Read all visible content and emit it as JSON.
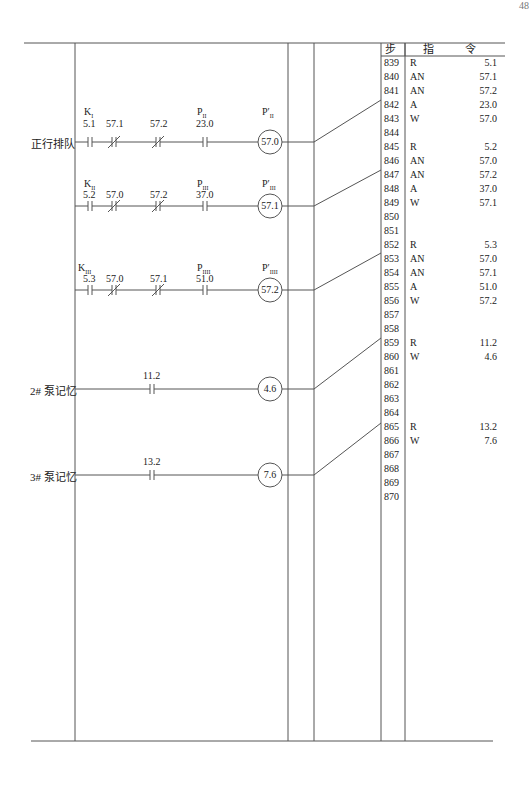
{
  "page": {
    "number": "48"
  },
  "table": {
    "header": {
      "step": "步",
      "instruction": "指 令"
    },
    "rows": [
      {
        "step": "839",
        "op": "R",
        "addr": "5.1"
      },
      {
        "step": "840",
        "op": "AN",
        "addr": "57.1"
      },
      {
        "step": "841",
        "op": "AN",
        "addr": "57.2"
      },
      {
        "step": "842",
        "op": "A",
        "addr": "23.0"
      },
      {
        "step": "843",
        "op": "W",
        "addr": "57.0"
      },
      {
        "step": "844",
        "op": "",
        "addr": ""
      },
      {
        "step": "845",
        "op": "R",
        "addr": "5.2"
      },
      {
        "step": "846",
        "op": "AN",
        "addr": "57.0"
      },
      {
        "step": "847",
        "op": "AN",
        "addr": "57.2"
      },
      {
        "step": "848",
        "op": "A",
        "addr": "37.0"
      },
      {
        "step": "849",
        "op": "W",
        "addr": "57.1"
      },
      {
        "step": "850",
        "op": "",
        "addr": ""
      },
      {
        "step": "851",
        "op": "",
        "addr": ""
      },
      {
        "step": "852",
        "op": "R",
        "addr": "5.3"
      },
      {
        "step": "853",
        "op": "AN",
        "addr": "57.0"
      },
      {
        "step": "854",
        "op": "AN",
        "addr": "57.1"
      },
      {
        "step": "855",
        "op": "A",
        "addr": "51.0"
      },
      {
        "step": "856",
        "op": "W",
        "addr": "57.2"
      },
      {
        "step": "857",
        "op": "",
        "addr": ""
      },
      {
        "step": "858",
        "op": "",
        "addr": ""
      },
      {
        "step": "859",
        "op": "R",
        "addr": "11.2"
      },
      {
        "step": "860",
        "op": "W",
        "addr": "4.6"
      },
      {
        "step": "861",
        "op": "",
        "addr": ""
      },
      {
        "step": "862",
        "op": "",
        "addr": ""
      },
      {
        "step": "863",
        "op": "",
        "addr": ""
      },
      {
        "step": "864",
        "op": "",
        "addr": ""
      },
      {
        "step": "865",
        "op": "R",
        "addr": "13.2"
      },
      {
        "step": "866",
        "op": "W",
        "addr": "7.6"
      },
      {
        "step": "867",
        "op": "",
        "addr": ""
      },
      {
        "step": "868",
        "op": "",
        "addr": ""
      },
      {
        "step": "869",
        "op": "",
        "addr": ""
      },
      {
        "step": "870",
        "op": "",
        "addr": ""
      }
    ]
  },
  "rungs": [
    {
      "label": "正行排队",
      "contacts": [
        {
          "tag": "K",
          "sub": "I",
          "addr": "5.1",
          "type": "NO"
        },
        {
          "tag": "",
          "sub": "",
          "addr": "57.1",
          "type": "NC"
        },
        {
          "tag": "",
          "sub": "",
          "addr": "57.2",
          "type": "NC"
        },
        {
          "tag": "P",
          "sub": "II",
          "addr": "23.0",
          "type": "NO"
        }
      ],
      "coil": {
        "tag": "P′",
        "sub": "II",
        "addr": "57.0"
      }
    },
    {
      "label": "",
      "contacts": [
        {
          "tag": "K",
          "sub": "II",
          "addr": "5.2",
          "type": "NO"
        },
        {
          "tag": "",
          "sub": "",
          "addr": "57.0",
          "type": "NC"
        },
        {
          "tag": "",
          "sub": "",
          "addr": "57.2",
          "type": "NC"
        },
        {
          "tag": "P",
          "sub": "III",
          "addr": "37.0",
          "type": "NO"
        }
      ],
      "coil": {
        "tag": "P′",
        "sub": "III",
        "addr": "57.1"
      }
    },
    {
      "label": "",
      "contacts": [
        {
          "tag": "K",
          "sub": "III",
          "addr": "5.3",
          "type": "NO"
        },
        {
          "tag": "",
          "sub": "",
          "addr": "57.0",
          "type": "NC"
        },
        {
          "tag": "",
          "sub": "",
          "addr": "57.1",
          "type": "NC"
        },
        {
          "tag": "P",
          "sub": "IIII",
          "addr": "51.0",
          "type": "NO"
        }
      ],
      "coil": {
        "tag": "P′",
        "sub": "IIII",
        "addr": "57.2"
      }
    },
    {
      "label": "2# 泵记忆",
      "contacts": [
        {
          "tag": "",
          "sub": "",
          "addr": "11.2",
          "type": "NO"
        }
      ],
      "coil": {
        "tag": "",
        "sub": "",
        "addr": "4.6"
      }
    },
    {
      "label": "3# 泵记忆",
      "contacts": [
        {
          "tag": "",
          "sub": "",
          "addr": "13.2",
          "type": "NO"
        }
      ],
      "coil": {
        "tag": "",
        "sub": "",
        "addr": "7.6"
      }
    }
  ]
}
